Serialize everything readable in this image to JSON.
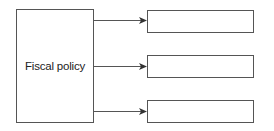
{
  "diagram": {
    "source": {
      "label": "Fiscal policy"
    },
    "targets": [
      {
        "label": ""
      },
      {
        "label": ""
      },
      {
        "label": ""
      }
    ],
    "colors": {
      "stroke": "#555555",
      "arrow": "#333333",
      "text": "#222222"
    }
  }
}
